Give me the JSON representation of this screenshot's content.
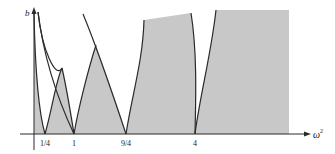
{
  "figure": {
    "type": "stability-diagram",
    "shade_color": "#c8c8c8",
    "curve_color": "#2a2a2a",
    "axes": {
      "y_label": "b",
      "x_label": "ω",
      "x_label_sup": "2"
    },
    "x_ticks": [
      {
        "label": "1/4",
        "value": 0.25
      },
      {
        "label": "1",
        "value": 1
      },
      {
        "label": "9/4",
        "value": 2.25
      },
      {
        "label": "4",
        "value": 4
      }
    ]
  }
}
